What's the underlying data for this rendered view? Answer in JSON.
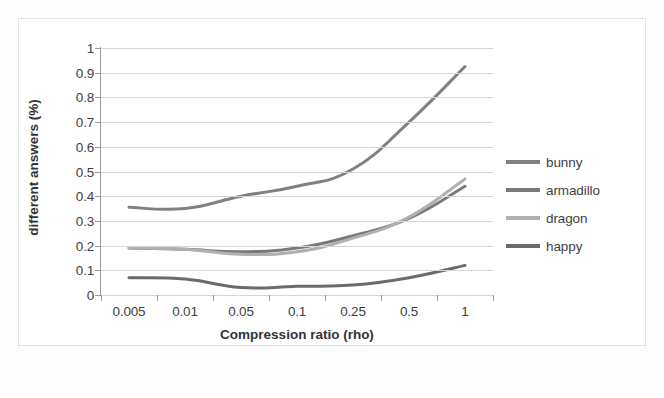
{
  "chart_data": {
    "type": "line",
    "title": "",
    "xlabel": "Compression ratio (rho)",
    "ylabel": "different answers (%)",
    "categories": [
      "0.005",
      "0.01",
      "0.05",
      "0.1",
      "0.25",
      "0.5",
      "1"
    ],
    "ylim": [
      0,
      1
    ],
    "yticks": [
      "0",
      "0.1",
      "0.2",
      "0.3",
      "0.4",
      "0.5",
      "0.6",
      "0.7",
      "0.8",
      "0.9",
      "1"
    ],
    "grid": "horizontal",
    "legend_position": "right",
    "series": [
      {
        "name": "bunny",
        "color": "#808080",
        "values": [
          0.355,
          0.35,
          0.4,
          0.44,
          0.51,
          0.7,
          0.925
        ]
      },
      {
        "name": "armadillo",
        "color": "#7a7a7a",
        "values": [
          0.19,
          0.185,
          0.175,
          0.19,
          0.24,
          0.31,
          0.44
        ]
      },
      {
        "name": "dragon",
        "color": "#b0b0b0",
        "values": [
          0.19,
          0.185,
          0.165,
          0.175,
          0.23,
          0.315,
          0.47
        ]
      },
      {
        "name": "happy",
        "color": "#6b6b6b",
        "values": [
          0.07,
          0.065,
          0.03,
          0.035,
          0.04,
          0.07,
          0.12
        ]
      }
    ]
  },
  "legend": {
    "items": [
      {
        "label": "bunny",
        "color": "#808080"
      },
      {
        "label": "armadillo",
        "color": "#7a7a7a"
      },
      {
        "label": "dragon",
        "color": "#b0b0b0"
      },
      {
        "label": "happy",
        "color": "#6b6b6b"
      }
    ]
  },
  "axes": {
    "x_title": "Compression ratio (rho)",
    "y_title": "different answers (%)"
  }
}
